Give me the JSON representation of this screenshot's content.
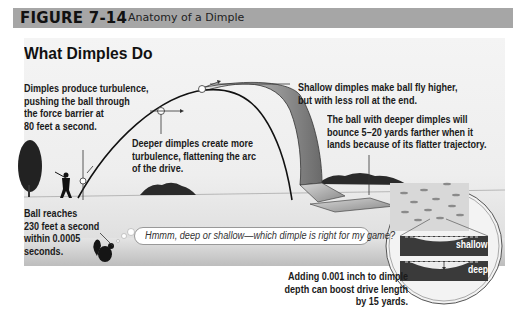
{
  "figure": {
    "number": "FIGURE 7-14",
    "title": "Anatomy of a Dimple"
  },
  "diagram": {
    "heading": "What Dimples Do",
    "callouts": {
      "turbulence": [
        "Dimples produce turbulence,",
        "pushing the ball through",
        "the force barrier at",
        "80 feet a second."
      ],
      "deeper": [
        "Deeper dimples create more",
        "turbulence, flattening the arc",
        "of the drive."
      ],
      "shallow": [
        "Shallow dimples make ball fly higher,",
        "but with less roll at the end."
      ],
      "bounce": [
        "The ball with deeper dimples will",
        "bounce 5–20 yards farther when it",
        "lands because of its flatter trajectory."
      ],
      "ball_reaches": [
        "Ball reaches",
        "230 feet a second",
        "within 0.0005",
        "seconds."
      ],
      "depth_boost": [
        "Adding 0.001 inch to dimple",
        "depth can boost drive length",
        "by 15 yards."
      ]
    },
    "thought_bubble": "Hmmm, deep or shallow—which dimple is right for my game?",
    "inset_labels": {
      "shallow": "shallow",
      "deep": "deep"
    },
    "icons": [
      "golfer-silhouette",
      "tree",
      "shrub",
      "squirrel-golfer",
      "golf-ball",
      "arrow",
      "magnifier-inset"
    ]
  }
}
